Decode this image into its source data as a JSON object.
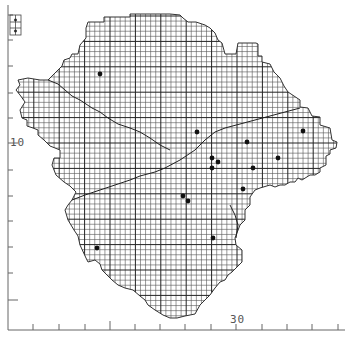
{
  "map": {
    "type": "grid distribution map (tetrad/1km grid with 10km squares)",
    "y_axis_label": "10",
    "x_axis_label": "30",
    "ink_color": "#222222",
    "grid_color": "#555555",
    "dot_color": "#111111",
    "records": [
      {
        "x": 100,
        "y": 74
      },
      {
        "x": 197,
        "y": 132
      },
      {
        "x": 247,
        "y": 142
      },
      {
        "x": 303,
        "y": 131
      },
      {
        "x": 212,
        "y": 158
      },
      {
        "x": 218,
        "y": 162
      },
      {
        "x": 212,
        "y": 168
      },
      {
        "x": 278,
        "y": 158
      },
      {
        "x": 253,
        "y": 168
      },
      {
        "x": 243,
        "y": 189
      },
      {
        "x": 183,
        "y": 196
      },
      {
        "x": 188,
        "y": 201
      },
      {
        "x": 213,
        "y": 238
      },
      {
        "x": 97,
        "y": 248
      }
    ],
    "x_ticks": [
      33,
      59,
      85,
      110,
      135,
      160,
      185,
      211,
      236,
      262,
      287,
      312,
      338
    ],
    "y_ticks": [
      15,
      40,
      66,
      93,
      118,
      143,
      170,
      196,
      221,
      247,
      273,
      300
    ]
  }
}
